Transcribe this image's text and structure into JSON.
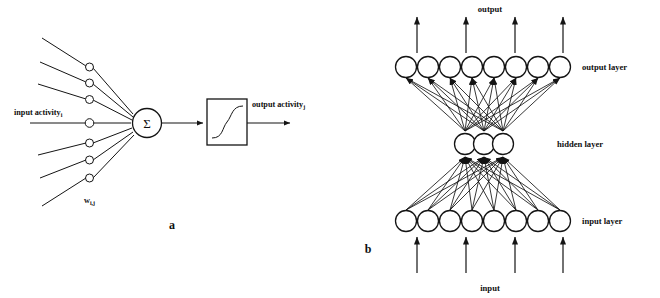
{
  "figure": {
    "title": "",
    "background_color": "#ffffff",
    "ink_color": "#141414",
    "panels": [
      {
        "id": "a",
        "panel_label": "a",
        "caption": "single artificial neuron: weighted inputs summed then passed through a sigmoid transfer function",
        "labels": {
          "input_activity": "input activity",
          "input_activity_subscript": "i",
          "weight": "w",
          "weight_subscript": "i,j",
          "output_activity": "output activity",
          "output_activity_subscript": "j",
          "summation_symbol": "Σ"
        },
        "synapse_count": 7,
        "transfer_function": "sigmoid"
      },
      {
        "id": "b",
        "panel_label": "b",
        "caption": "three layer feed forward network, fully connected",
        "labels": {
          "output": "output",
          "output_layer": "output layer",
          "hidden_layer": "hidden layer",
          "input_layer": "input layer",
          "input": "input"
        },
        "layers": [
          {
            "name": "output layer",
            "node_count": 8
          },
          {
            "name": "hidden layer",
            "node_count": 3
          },
          {
            "name": "input layer",
            "node_count": 8
          }
        ],
        "external_arrows": {
          "top_count": 4,
          "bottom_count": 4
        }
      }
    ]
  }
}
